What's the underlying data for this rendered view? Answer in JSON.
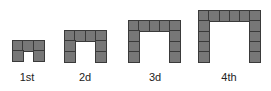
{
  "colors": {
    "cell_fill": "#777777",
    "cell_border": "#3a3a3a",
    "background": "#ffffff",
    "label_text": "#222222"
  },
  "figures": [
    {
      "label": "1st",
      "width_cells": 3,
      "height_cells": 2,
      "left": 12,
      "bottom": 61,
      "label_center": 27
    },
    {
      "label": "2d",
      "width_cells": 4,
      "height_cells": 3,
      "left": 64,
      "bottom": 61,
      "label_center": 85
    },
    {
      "label": "3d",
      "width_cells": 5,
      "height_cells": 4,
      "left": 128,
      "bottom": 61,
      "label_center": 155
    },
    {
      "label": "4th",
      "width_cells": 6,
      "height_cells": 5,
      "left": 198,
      "bottom": 61,
      "label_center": 229
    }
  ],
  "cell_size": 10
}
